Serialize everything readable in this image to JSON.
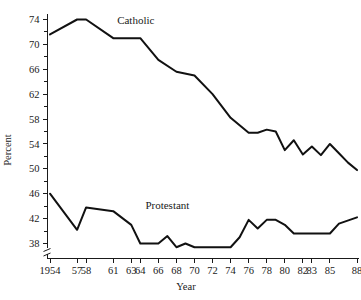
{
  "chart_data": {
    "type": "line",
    "title": "",
    "xlabel": "Year",
    "ylabel": "Percent",
    "xlim": [
      1954,
      1988
    ],
    "ylim": [
      37,
      75.2
    ],
    "grid": false,
    "legend_position": "inline-labels",
    "y_axis_break": true,
    "y_ticks_major": [
      38,
      42,
      46,
      50,
      54,
      58,
      62,
      66,
      70,
      74
    ],
    "y_ticks_minor": [
      40,
      44,
      48,
      52,
      56,
      60,
      64,
      68,
      72
    ],
    "x_tick_years": [
      1954,
      1957,
      1958,
      1961,
      1963,
      1964,
      1966,
      1968,
      1970,
      1972,
      1974,
      1976,
      1978,
      1980,
      1982,
      1983,
      1985,
      1988
    ],
    "x_tick_labels": [
      "1954",
      "57",
      "58",
      "61",
      "63",
      "64",
      "66",
      "68",
      "70",
      "72",
      "74",
      "76",
      "78",
      "80",
      "82",
      "83",
      "85",
      "88"
    ],
    "series": [
      {
        "name": "Catholic",
        "label": "Catholic",
        "label_year": 1963.5,
        "label_value": 73.2,
        "color": "#111111",
        "x": [
          1954,
          1957,
          1958,
          1961,
          1963,
          1964,
          1966,
          1968,
          1970,
          1972,
          1974,
          1976,
          1977,
          1978,
          1979,
          1980,
          1981,
          1982,
          1983,
          1984,
          1985,
          1986,
          1987,
          1988
        ],
        "values": [
          71.6,
          74.0,
          74.0,
          71.0,
          71.0,
          71.0,
          67.5,
          65.6,
          65.0,
          62.0,
          58.2,
          55.8,
          55.8,
          56.3,
          56.0,
          53.0,
          54.6,
          52.3,
          53.6,
          52.2,
          54.0,
          52.5,
          51.0,
          49.8
        ]
      },
      {
        "name": "Protestant",
        "label": "Protestant",
        "label_year": 1967.0,
        "label_value": 43.6,
        "color": "#111111",
        "x": [
          1954,
          1957,
          1958,
          1961,
          1963,
          1964,
          1966,
          1967,
          1968,
          1969,
          1970,
          1971,
          1972,
          1974,
          1975,
          1976,
          1977,
          1978,
          1979,
          1980,
          1981,
          1982,
          1983,
          1985,
          1986,
          1988
        ],
        "values": [
          46.0,
          40.2,
          43.8,
          43.2,
          41.0,
          38.0,
          38.0,
          39.2,
          37.4,
          38.0,
          37.4,
          37.4,
          37.4,
          37.4,
          39.0,
          41.8,
          40.4,
          41.8,
          41.8,
          41.0,
          39.6,
          39.6,
          39.6,
          39.6,
          41.2,
          42.2
        ]
      }
    ]
  },
  "labels": {
    "y_axis_title": "Percent",
    "x_axis_title": "Year"
  }
}
